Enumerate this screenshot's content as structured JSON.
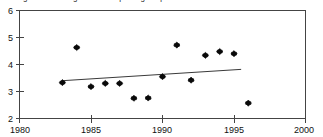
{
  "figure": {
    "title": "Figure 1: Average 'reach' reporting frequencies for 1983-1996",
    "title_note": "clipped at top edge of screenshot"
  },
  "axis": {
    "x_ticks": [
      "1980",
      "1985",
      "1990",
      "1995",
      "2000"
    ],
    "y_ticks": [
      "2",
      "3",
      "4",
      "5",
      "6"
    ]
  },
  "chart_data": {
    "type": "scatter",
    "title": "Figure 1: Average 'reach' reporting frequencies for 1983-1996",
    "xlabel": "",
    "ylabel": "",
    "xlim": [
      1980,
      2000
    ],
    "ylim": [
      2,
      6
    ],
    "xticks": [
      1980,
      1985,
      1990,
      1995,
      2000
    ],
    "yticks": [
      2,
      3,
      4,
      5,
      6
    ],
    "grid": false,
    "legend": null,
    "x": [
      1983,
      1984,
      1985,
      1986,
      1987,
      1988,
      1989,
      1990,
      1991,
      1992,
      1993,
      1994,
      1995,
      1996
    ],
    "y": [
      3.33,
      4.63,
      3.18,
      3.3,
      3.3,
      2.75,
      2.76,
      3.55,
      4.72,
      3.42,
      4.34,
      4.48,
      4.4,
      2.57
    ],
    "marker": "diamond",
    "marker_color": "#0a0a0a",
    "series": [
      {
        "name": "Average reporting frequency",
        "x": [
          1983,
          1984,
          1985,
          1986,
          1987,
          1988,
          1989,
          1990,
          1991,
          1992,
          1993,
          1994,
          1995,
          1996
        ],
        "values": [
          3.33,
          4.63,
          3.18,
          3.3,
          3.3,
          2.75,
          2.76,
          3.55,
          4.72,
          3.42,
          4.34,
          4.48,
          4.4,
          2.57
        ]
      }
    ],
    "trend_line": {
      "type": "linear",
      "x_start": 1983,
      "y_start": 3.4,
      "x_end": 1995.5,
      "y_end": 3.82,
      "color": "#3a3a3a"
    }
  }
}
